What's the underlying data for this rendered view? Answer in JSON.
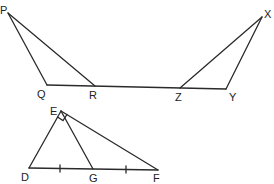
{
  "figures": [
    {
      "name": "triangle-PQR",
      "vertices": {
        "P": [
          8,
          13
        ],
        "Q": [
          47,
          85
        ],
        "R": [
          95,
          86
        ]
      },
      "labels": {
        "P": "P",
        "Q": "Q",
        "R": "R"
      }
    },
    {
      "name": "triangle-XYZ",
      "vertices": {
        "X": [
          262,
          17
        ],
        "Y": [
          226,
          89
        ],
        "Z": [
          180,
          88
        ]
      },
      "labels": {
        "X": "X",
        "Y": "Y",
        "Z": "Z"
      }
    },
    {
      "name": "triangle-DEF",
      "vertices": {
        "D": [
          29,
          168
        ],
        "E": [
          61,
          111
        ],
        "F": [
          158,
          170
        ],
        "G": [
          93,
          169
        ]
      },
      "labels": {
        "D": "D",
        "E": "E",
        "F": "F",
        "G": "G"
      },
      "right_angle_at": "E",
      "equal_segments": [
        "DG",
        "GF"
      ]
    }
  ],
  "baseline": {
    "from": "Q",
    "to": "Y"
  },
  "labels": {
    "P": "P",
    "Q": "Q",
    "R": "R",
    "X": "X",
    "Y": "Y",
    "Z": "Z",
    "D": "D",
    "E": "E",
    "F": "F",
    "G": "G"
  }
}
